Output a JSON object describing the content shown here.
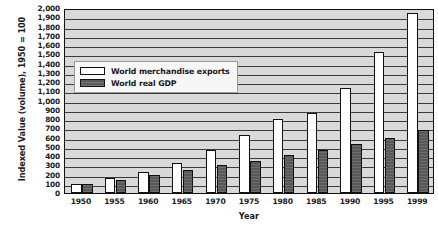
{
  "chart_data": {
    "type": "bar",
    "title": "",
    "xlabel": "Year",
    "ylabel": "Indexed Value (volume), 1950 = 100",
    "categories": [
      "1950",
      "1955",
      "1960",
      "1965",
      "1970",
      "1975",
      "1980",
      "1985",
      "1990",
      "1995",
      "1999"
    ],
    "series": [
      {
        "name": "World merchandise exports",
        "color": "#ffffff",
        "values": [
          100,
          160,
          225,
          320,
          465,
          625,
          800,
          860,
          1130,
          1520,
          1950
        ]
      },
      {
        "name": "World real GDP",
        "color": "#595959",
        "values": [
          100,
          145,
          190,
          245,
          300,
          345,
          415,
          470,
          525,
          590,
          680
        ]
      }
    ],
    "ylim": [
      0,
      2000
    ],
    "ytick_step": 100,
    "yticks": [
      "0",
      "100",
      "200",
      "300",
      "400",
      "500",
      "600",
      "700",
      "800",
      "900",
      "1,000",
      "1,100",
      "1,200",
      "1,300",
      "1,400",
      "1,500",
      "1,600",
      "1,700",
      "1,800",
      "1,900",
      "2,000"
    ],
    "grid": true,
    "legend_position": "upper-left-inside",
    "plot_background": "#d9d9d9"
  }
}
